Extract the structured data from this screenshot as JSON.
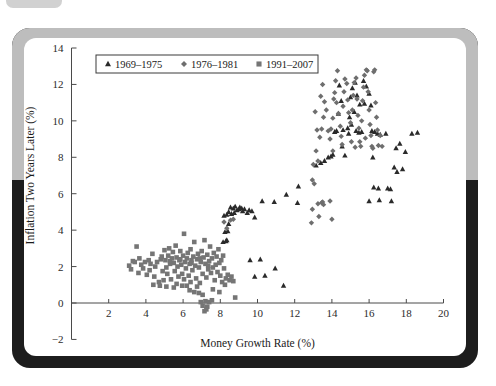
{
  "figure": {
    "frame_color": "#bdbdbd",
    "shadow_color": "#1d1d1d",
    "background": "#ffffff"
  },
  "chart_data": {
    "type": "scatter",
    "title": "",
    "xlabel": "Money Growth Rate (%)",
    "ylabel": "Inflation Two Years Later (%)",
    "xlim": [
      0,
      20
    ],
    "ylim": [
      -2,
      14
    ],
    "xticks": [
      2,
      4,
      6,
      8,
      10,
      12,
      14,
      16,
      18,
      20
    ],
    "yticks": [
      -2,
      0,
      2,
      4,
      6,
      8,
      10,
      12,
      14
    ],
    "grid": false,
    "legend_position": "upper-left",
    "series": [
      {
        "name": "1969–1975",
        "marker": "triangle",
        "color": "#2a2a2a",
        "points": [
          [
            8.15,
            3.35
          ],
          [
            8.3,
            3.4
          ],
          [
            8.35,
            3.45
          ],
          [
            8.25,
            3.9
          ],
          [
            8.4,
            3.95
          ],
          [
            8.45,
            4.35
          ],
          [
            8.2,
            4.8
          ],
          [
            8.35,
            4.85
          ],
          [
            8.6,
            4.9
          ],
          [
            8.75,
            4.95
          ],
          [
            8.9,
            5.1
          ],
          [
            9.0,
            5.15
          ],
          [
            9.15,
            5.2
          ],
          [
            9.3,
            5.15
          ],
          [
            9.45,
            4.95
          ],
          [
            9.55,
            5.1
          ],
          [
            9.7,
            5.05
          ],
          [
            9.85,
            4.7
          ],
          [
            8.55,
            5.25
          ],
          [
            8.7,
            5.2
          ],
          [
            9.05,
            5.25
          ],
          [
            9.2,
            5.05
          ],
          [
            8.45,
            5.0
          ],
          [
            8.8,
            5.3
          ],
          [
            10.25,
            5.6
          ],
          [
            10.9,
            5.55
          ],
          [
            11.55,
            5.95
          ],
          [
            12.2,
            6.4
          ],
          [
            12.15,
            5.5
          ],
          [
            9.6,
            2.35
          ],
          [
            10.15,
            2.4
          ],
          [
            9.85,
            1.45
          ],
          [
            10.4,
            1.5
          ],
          [
            10.95,
            1.9
          ],
          [
            11.4,
            0.95
          ],
          [
            13.15,
            7.55
          ],
          [
            13.4,
            7.7
          ],
          [
            13.6,
            7.8
          ],
          [
            13.8,
            8.0
          ],
          [
            14.05,
            8.15
          ],
          [
            14.15,
            9.4
          ],
          [
            14.35,
            10.4
          ],
          [
            14.5,
            11.1
          ],
          [
            14.4,
            11.95
          ],
          [
            14.6,
            9.5
          ],
          [
            14.55,
            8.6
          ],
          [
            14.7,
            8.1
          ],
          [
            14.85,
            9.6
          ],
          [
            14.95,
            10.2
          ],
          [
            15.0,
            11.3
          ],
          [
            15.1,
            11.8
          ],
          [
            15.25,
            12.1
          ],
          [
            15.35,
            11.4
          ],
          [
            15.2,
            10.5
          ],
          [
            15.05,
            9.8
          ],
          [
            14.9,
            9.3
          ],
          [
            15.45,
            9.35
          ],
          [
            15.6,
            9.4
          ],
          [
            15.5,
            10.9
          ],
          [
            15.7,
            12.2
          ],
          [
            15.85,
            11.9
          ],
          [
            16.0,
            11.5
          ],
          [
            16.1,
            10.85
          ],
          [
            16.15,
            9.45
          ],
          [
            16.3,
            9.4
          ],
          [
            16.45,
            9.3
          ],
          [
            16.6,
            9.25
          ],
          [
            16.2,
            8.0
          ],
          [
            16.25,
            6.35
          ],
          [
            16.5,
            6.3
          ],
          [
            16.0,
            5.6
          ],
          [
            16.55,
            5.65
          ],
          [
            17.0,
            6.3
          ],
          [
            17.15,
            6.25
          ],
          [
            17.2,
            5.6
          ],
          [
            17.35,
            7.45
          ],
          [
            17.5,
            7.2
          ],
          [
            17.45,
            8.5
          ],
          [
            17.65,
            8.75
          ],
          [
            17.8,
            7.35
          ],
          [
            17.95,
            8.3
          ],
          [
            18.3,
            9.3
          ],
          [
            18.6,
            9.35
          ],
          [
            16.9,
            9.3
          ],
          [
            15.75,
            10.95
          ],
          [
            15.3,
            9.45
          ],
          [
            14.25,
            9.45
          ],
          [
            13.95,
            8.05
          ]
        ]
      },
      {
        "name": "1976–1981",
        "marker": "diamond",
        "color": "#6e6e6e",
        "points": [
          [
            13.1,
            10.5
          ],
          [
            13.2,
            9.5
          ],
          [
            13.35,
            9.1
          ],
          [
            13.45,
            9.55
          ],
          [
            13.55,
            10.2
          ],
          [
            13.15,
            8.35
          ],
          [
            13.0,
            7.6
          ],
          [
            12.95,
            6.75
          ],
          [
            13.05,
            6.55
          ],
          [
            13.25,
            7.8
          ],
          [
            13.4,
            11.35
          ],
          [
            13.5,
            12.0
          ],
          [
            13.6,
            11.05
          ],
          [
            13.7,
            10.6
          ],
          [
            13.8,
            9.45
          ],
          [
            13.9,
            9.0
          ],
          [
            13.95,
            9.55
          ],
          [
            14.05,
            10.15
          ],
          [
            14.1,
            11.2
          ],
          [
            14.15,
            11.55
          ],
          [
            14.2,
            12.2
          ],
          [
            14.3,
            12.75
          ],
          [
            14.25,
            11.0
          ],
          [
            14.35,
            10.4
          ],
          [
            14.45,
            9.7
          ],
          [
            14.5,
            9.15
          ],
          [
            14.55,
            8.7
          ],
          [
            14.6,
            10.8
          ],
          [
            14.65,
            11.6
          ],
          [
            14.7,
            12.3
          ],
          [
            14.8,
            12.05
          ],
          [
            14.85,
            11.15
          ],
          [
            14.9,
            10.45
          ],
          [
            15.0,
            9.9
          ],
          [
            15.05,
            8.85
          ],
          [
            15.1,
            10.6
          ],
          [
            15.15,
            11.4
          ],
          [
            15.2,
            12.1
          ],
          [
            15.3,
            12.35
          ],
          [
            15.35,
            11.2
          ],
          [
            15.4,
            10.3
          ],
          [
            15.45,
            9.6
          ],
          [
            15.5,
            8.85
          ],
          [
            15.55,
            8.6
          ],
          [
            15.6,
            10.0
          ],
          [
            15.65,
            11.1
          ],
          [
            15.7,
            11.85
          ],
          [
            15.75,
            12.5
          ],
          [
            15.85,
            12.8
          ],
          [
            15.9,
            12.75
          ],
          [
            15.95,
            11.6
          ],
          [
            16.0,
            10.6
          ],
          [
            16.05,
            9.8
          ],
          [
            16.1,
            9.2
          ],
          [
            16.15,
            8.6
          ],
          [
            16.2,
            8.5
          ],
          [
            16.25,
            12.7
          ],
          [
            16.3,
            12.8
          ],
          [
            16.35,
            11.0
          ],
          [
            16.4,
            10.2
          ],
          [
            16.45,
            9.5
          ],
          [
            16.5,
            8.65
          ],
          [
            12.95,
            5.15
          ],
          [
            13.25,
            5.45
          ],
          [
            13.45,
            5.5
          ],
          [
            13.5,
            5.55
          ],
          [
            13.55,
            5.4
          ],
          [
            13.9,
            5.6
          ],
          [
            14.0,
            4.6
          ],
          [
            12.9,
            4.4
          ],
          [
            13.3,
            4.75
          ],
          [
            8.2,
            4.45
          ],
          [
            8.35,
            4.1
          ],
          [
            8.55,
            4.55
          ],
          [
            8.7,
            4.6
          ],
          [
            16.6,
            9.2
          ],
          [
            16.7,
            8.6
          ],
          [
            14.05,
            8.35
          ],
          [
            15.8,
            9.05
          ],
          [
            15.25,
            8.55
          ]
        ]
      },
      {
        "name": "1991–2007",
        "marker": "square",
        "color": "#757575",
        "points": [
          [
            3.1,
            2.05
          ],
          [
            3.2,
            1.85
          ],
          [
            3.3,
            2.3
          ],
          [
            3.4,
            2.25
          ],
          [
            3.5,
            3.1
          ],
          [
            3.6,
            1.65
          ],
          [
            3.75,
            2.1
          ],
          [
            3.85,
            1.9
          ],
          [
            3.95,
            2.25
          ],
          [
            4.05,
            1.55
          ],
          [
            4.15,
            2.35
          ],
          [
            4.25,
            2.15
          ],
          [
            4.35,
            2.7
          ],
          [
            4.45,
            1.45
          ],
          [
            4.5,
            2.0
          ],
          [
            4.6,
            2.25
          ],
          [
            4.7,
            1.15
          ],
          [
            4.8,
            2.4
          ],
          [
            4.85,
            2.55
          ],
          [
            4.9,
            1.75
          ],
          [
            5.0,
            2.9
          ],
          [
            5.05,
            2.35
          ],
          [
            5.1,
            1.95
          ],
          [
            5.15,
            1.6
          ],
          [
            5.2,
            2.6
          ],
          [
            5.25,
            3.0
          ],
          [
            5.3,
            2.15
          ],
          [
            5.35,
            1.3
          ],
          [
            5.4,
            2.45
          ],
          [
            5.45,
            2.8
          ],
          [
            5.5,
            2.2
          ],
          [
            5.55,
            1.75
          ],
          [
            5.6,
            3.15
          ],
          [
            5.65,
            2.5
          ],
          [
            5.7,
            2.0
          ],
          [
            5.75,
            1.45
          ],
          [
            5.8,
            2.35
          ],
          [
            5.85,
            2.85
          ],
          [
            5.9,
            2.1
          ],
          [
            5.95,
            1.6
          ],
          [
            6.0,
            2.6
          ],
          [
            6.05,
            3.8
          ],
          [
            6.1,
            2.25
          ],
          [
            6.15,
            1.9
          ],
          [
            6.2,
            2.45
          ],
          [
            6.25,
            2.75
          ],
          [
            6.3,
            1.5
          ],
          [
            6.35,
            2.15
          ],
          [
            6.4,
            2.95
          ],
          [
            6.45,
            2.35
          ],
          [
            6.5,
            1.8
          ],
          [
            6.55,
            2.55
          ],
          [
            6.6,
            3.35
          ],
          [
            6.65,
            2.05
          ],
          [
            6.7,
            1.35
          ],
          [
            6.75,
            2.4
          ],
          [
            6.8,
            2.7
          ],
          [
            6.85,
            1.95
          ],
          [
            6.9,
            1.1
          ],
          [
            6.95,
            2.25
          ],
          [
            7.0,
            2.85
          ],
          [
            7.05,
            1.6
          ],
          [
            7.1,
            2.5
          ],
          [
            7.15,
            3.45
          ],
          [
            7.2,
            2.15
          ],
          [
            7.25,
            1.4
          ],
          [
            7.3,
            2.65
          ],
          [
            7.35,
            1.85
          ],
          [
            7.4,
            2.3
          ],
          [
            7.45,
            3.1
          ],
          [
            7.5,
            1.65
          ],
          [
            7.55,
            2.45
          ],
          [
            7.6,
            1.95
          ],
          [
            7.65,
            2.75
          ],
          [
            7.7,
            1.25
          ],
          [
            7.75,
            2.1
          ],
          [
            7.8,
            2.55
          ],
          [
            7.85,
            1.7
          ],
          [
            7.9,
            2.95
          ],
          [
            7.95,
            2.2
          ],
          [
            8.0,
            1.5
          ],
          [
            8.05,
            2.35
          ],
          [
            8.1,
            1.15
          ],
          [
            8.15,
            2.6
          ],
          [
            8.2,
            1.9
          ],
          [
            8.3,
            1.35
          ],
          [
            8.4,
            1.55
          ],
          [
            8.5,
            1.25
          ],
          [
            8.6,
            1.45
          ],
          [
            8.7,
            1.2
          ],
          [
            8.8,
            0.3
          ],
          [
            4.4,
            1.0
          ],
          [
            4.75,
            0.95
          ],
          [
            5.5,
            0.85
          ],
          [
            5.95,
            0.95
          ],
          [
            6.35,
            0.7
          ],
          [
            6.6,
            0.6
          ],
          [
            6.85,
            0.55
          ],
          [
            7.05,
            0.45
          ],
          [
            7.2,
            0.1
          ],
          [
            7.3,
            -0.2
          ],
          [
            7.15,
            -0.45
          ],
          [
            7.25,
            -0.35
          ],
          [
            7.4,
            0.05
          ],
          [
            7.55,
            0.15
          ],
          [
            7.95,
            0.6
          ],
          [
            6.95,
            0.05
          ],
          [
            7.05,
            -0.15
          ],
          [
            6.4,
            1.15
          ],
          [
            5.1,
            0.9
          ],
          [
            4.95,
            1.25
          ],
          [
            5.65,
            1.05
          ],
          [
            6.05,
            1.3
          ],
          [
            6.2,
            0.95
          ],
          [
            6.75,
            0.9
          ],
          [
            7.6,
            0.75
          ],
          [
            5.3,
            2.3
          ],
          [
            5.85,
            2.4
          ],
          [
            6.45,
            2.2
          ],
          [
            6.9,
            2.45
          ],
          [
            7.35,
            2.05
          ],
          [
            4.2,
            1.8
          ],
          [
            3.65,
            2.45
          ],
          [
            8.25,
            1.0
          ]
        ]
      }
    ]
  },
  "axes": {
    "x_tick_labels": [
      "2",
      "4",
      "6",
      "8",
      "10",
      "12",
      "14",
      "16",
      "18",
      "20"
    ],
    "y_tick_labels": [
      "14",
      "12",
      "10",
      "8",
      "6",
      "4",
      "2",
      "0",
      "−2"
    ]
  },
  "legend": {
    "entries": [
      {
        "label": "1969–1975",
        "marker": "triangle",
        "color": "#2a2a2a"
      },
      {
        "label": "1976–1981",
        "marker": "diamond",
        "color": "#6e6e6e"
      },
      {
        "label": "1991–2007",
        "marker": "square",
        "color": "#757575"
      }
    ]
  }
}
